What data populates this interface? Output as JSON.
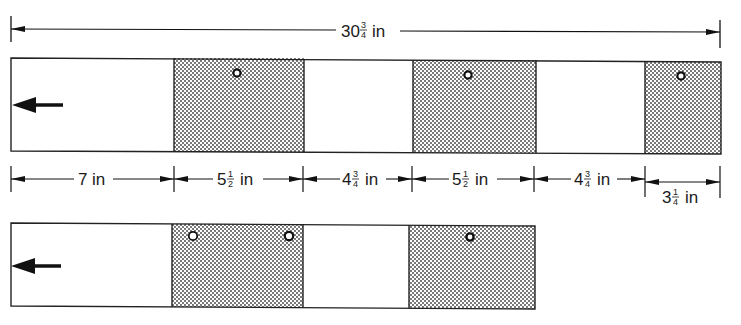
{
  "diagram": {
    "overall_dimension": {
      "whole": "30",
      "frac_num": "3",
      "frac_den": "4",
      "unit": "in"
    },
    "top_strip": {
      "direction_arrow": "left-arrow",
      "segments": [
        {
          "type": "plain",
          "length": "7 in"
        },
        {
          "type": "shaded",
          "length": "5 1/2 in",
          "holes": 1
        },
        {
          "type": "plain",
          "length": "4 3/4 in"
        },
        {
          "type": "shaded",
          "length": "5 1/2 in",
          "holes": 1
        },
        {
          "type": "plain",
          "length": "4 3/4 in"
        },
        {
          "type": "shaded",
          "length": "3 1/4 in",
          "holes": 1
        }
      ]
    },
    "segment_dimensions": [
      {
        "whole": "7",
        "frac_num": "",
        "frac_den": "",
        "unit": "in"
      },
      {
        "whole": "5",
        "frac_num": "1",
        "frac_den": "2",
        "unit": "in"
      },
      {
        "whole": "4",
        "frac_num": "3",
        "frac_den": "4",
        "unit": "in"
      },
      {
        "whole": "5",
        "frac_num": "1",
        "frac_den": "2",
        "unit": "in"
      },
      {
        "whole": "4",
        "frac_num": "3",
        "frac_den": "4",
        "unit": "in"
      },
      {
        "whole": "3",
        "frac_num": "1",
        "frac_den": "4",
        "unit": "in"
      }
    ],
    "bottom_strip": {
      "direction_arrow": "left-arrow",
      "segments": [
        {
          "type": "plain"
        },
        {
          "type": "shaded",
          "holes": 2
        },
        {
          "type": "plain"
        },
        {
          "type": "shaded",
          "holes": 1
        }
      ]
    }
  }
}
